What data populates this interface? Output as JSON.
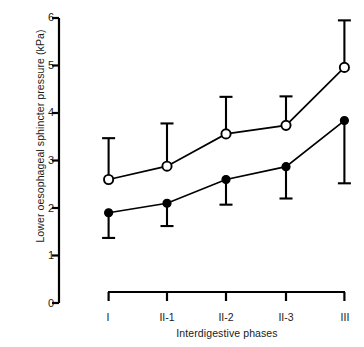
{
  "chart_data": {
    "type": "line",
    "title": "",
    "xlabel": "Interdigestive phases",
    "ylabel": "Lower oesophageal sphincter pressure (kPa)",
    "categories": [
      "I",
      "II-1",
      "II-2",
      "II-3",
      "III"
    ],
    "ylim": [
      0,
      6
    ],
    "yticks": [
      0,
      1,
      2,
      3,
      4,
      5,
      6
    ],
    "ytick_labels": [
      "0",
      "1",
      "2",
      "3",
      "4",
      "5",
      "6"
    ],
    "grid": false,
    "legend": "none",
    "series": [
      {
        "name": "open-circles",
        "marker": "open-circle",
        "error_direction": "up",
        "values": [
          2.6,
          2.88,
          3.56,
          3.74,
          4.96
        ],
        "error_upper": [
          3.47,
          3.78,
          4.34,
          4.35,
          5.95
        ]
      },
      {
        "name": "filled-circles",
        "marker": "filled-circle",
        "error_direction": "down",
        "values": [
          1.9,
          2.1,
          2.6,
          2.87,
          3.84
        ],
        "error_lower": [
          1.37,
          1.62,
          2.07,
          2.2,
          2.52
        ]
      }
    ],
    "colors": {
      "line": "#000000",
      "marker_fill_open": "#ffffff",
      "marker_fill_closed": "#000000",
      "background": "#ffffff"
    }
  },
  "axis": {
    "y_label_text": "Lower oesophageal sphincter pressure (kPa)",
    "x_label_text": "Interdigestive phases"
  }
}
